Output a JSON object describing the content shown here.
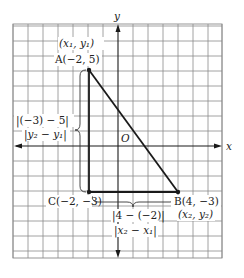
{
  "diagram": {
    "axes": {
      "x_label": "x",
      "y_label": "y",
      "origin_label": "O"
    },
    "grid": {
      "unit_px": 15,
      "origin_px": [
        118,
        146
      ],
      "x_range": [
        -7,
        7
      ],
      "y_range": [
        -7.5,
        8.1
      ]
    },
    "points": {
      "A": {
        "label": "A(−2, 5)",
        "coords": [
          -2,
          5
        ],
        "generic": "(x₁, y₁)"
      },
      "B": {
        "label": "B(4, −3)",
        "coords": [
          4,
          -3
        ],
        "generic": "(x₂, y₂)"
      },
      "C": {
        "label": "C(−2, −3)",
        "coords": [
          -2,
          -3
        ]
      }
    },
    "vertical_distance": {
      "expr": "|(−3) − 5|",
      "formula": "|y₂ − y₁|"
    },
    "horizontal_distance": {
      "expr": "|4 − (−2)|",
      "formula": "|x₂ − x₁|"
    },
    "colors": {
      "grid": "#8a8a8a",
      "ink": "#1a1a1a",
      "background": "#ffffff"
    }
  }
}
